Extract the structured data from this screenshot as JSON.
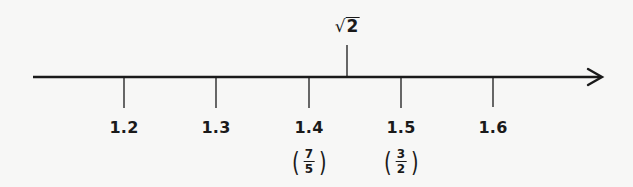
{
  "diagram": {
    "type": "number-line",
    "axis": {
      "x_start": 33,
      "x_end": 602,
      "y": 77,
      "direction": "right-arrow"
    },
    "ticks": [
      {
        "value": "1.2",
        "x": 124
      },
      {
        "value": "1.3",
        "x": 216
      },
      {
        "value": "1.4",
        "x": 309
      },
      {
        "value": "1.5",
        "x": 401
      },
      {
        "value": "1.6",
        "x": 493
      }
    ],
    "fraction_labels": [
      {
        "for_tick": "1.4",
        "numerator": "7",
        "denominator": "5",
        "x": 309
      },
      {
        "for_tick": "1.5",
        "numerator": "3",
        "denominator": "2",
        "x": 401
      }
    ],
    "marker": {
      "symbol": "√",
      "radicand": "2",
      "label": "√2",
      "approx_value": 1.414,
      "x": 347
    }
  }
}
